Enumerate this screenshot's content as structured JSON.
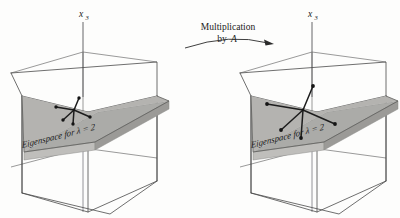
{
  "figure": {
    "title_text": "",
    "background_color": "#fdfdfc",
    "plane_color": "#ababa8",
    "ink_color": "#1d1d1d"
  },
  "transform_arrow": {
    "label_line1": "Multiplication",
    "label_line2": "by",
    "label_operator": "A",
    "direction": "left-to-right"
  },
  "panels": [
    {
      "id": "before",
      "axis_label": "x",
      "axis_subscript": "3",
      "plane_label_prefix": "Eigenspace for",
      "plane_label_lambda": "λ",
      "plane_label_suffix": "= 2",
      "eigenvalue": "2",
      "vector_count": 5,
      "vector_scale": 1
    },
    {
      "id": "after",
      "axis_label": "x",
      "axis_subscript": "3",
      "plane_label_prefix": "Eigenspace for",
      "plane_label_lambda": "λ",
      "plane_label_suffix": "= 2",
      "eigenvalue": "2",
      "vector_count": 5,
      "vector_scale": 2
    }
  ]
}
